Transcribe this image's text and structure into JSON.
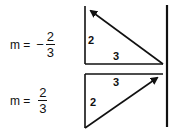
{
  "equations": [
    {
      "lhs": "m =",
      "sign": "−",
      "numerator": "2",
      "denominator": "3"
    },
    {
      "lhs": "m =",
      "sign": "",
      "numerator": "2",
      "denominator": "3"
    }
  ],
  "triangles": [
    {
      "name": "negative-slope",
      "rise_label": "2",
      "run_label": "3",
      "arrow_direction": "up-left"
    },
    {
      "name": "positive-slope",
      "rise_label": "2",
      "run_label": "3",
      "arrow_direction": "up-right"
    }
  ],
  "colors": {
    "ink": "#111111",
    "background": "#ffffff"
  }
}
